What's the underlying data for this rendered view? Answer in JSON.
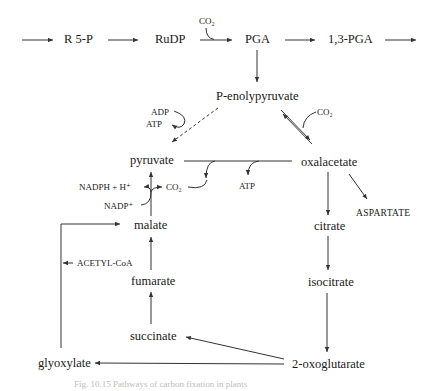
{
  "figure": {
    "top_row": {
      "r5p": "R 5-P",
      "rudp": "RuDP",
      "co2_in": "CO₂",
      "pga": "PGA",
      "pga13": "1,3-PGA"
    },
    "metabolites": {
      "pep": "P-enolypyruvate",
      "pyruvate": "pyruvate",
      "oxalacetate": "oxalacetate",
      "malate": "malate",
      "citrate": "citrate",
      "isocitrate": "isocitrate",
      "fumarate": "fumarate",
      "succinate": "succinate",
      "glyoxylate": "glyoxylate",
      "oxoglutarate": "2-oxoglutarate",
      "aspartate": "ASPARTATE"
    },
    "cofactors": {
      "adp": "ADP",
      "atp_pep": "ATP",
      "co2_pep": "CO₂",
      "atp_pyr": "ATP",
      "nadph": "NADPH + H⁺",
      "co2_malic": "CO₂",
      "nadp": "NADP⁺",
      "acetylcoa": "ACETYL-CoA"
    },
    "caption": "Fig. 10.15 Pathways of carbon fixation in plants"
  }
}
